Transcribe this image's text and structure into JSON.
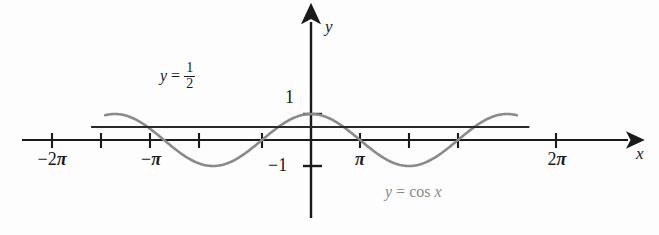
{
  "figure": {
    "background_color": "#fdfdfd"
  },
  "axes": {
    "x_axis_label": "x",
    "y_axis_label": "y",
    "axis_color": "#1a1a1a",
    "x_tick_labels": [
      {
        "text": "−2",
        "pi": "π",
        "value": -6.2832
      },
      {
        "text": "−",
        "pi": "π",
        "value": -3.1416
      },
      {
        "text": "",
        "pi": "π",
        "value": 3.1416
      },
      {
        "text": "2",
        "pi": "π",
        "value": 6.2832
      }
    ],
    "y_tick_labels": [
      {
        "text": "1",
        "value": 1
      },
      {
        "text": "−1",
        "value": -1
      }
    ]
  },
  "annotations": {
    "half_line_label": {
      "lhs": "y",
      "eq": "=",
      "num": "1",
      "den": "2"
    },
    "cosine_label": {
      "lhs": "y",
      "eq": "=",
      "fn": "cos",
      "arg": "x"
    }
  },
  "chart_data": {
    "type": "line",
    "title": "",
    "xlabel": "x",
    "ylabel": "y",
    "xlim": [
      -7.5,
      7.6
    ],
    "ylim": [
      -1.6,
      2.1
    ],
    "grid": false,
    "legend": "inline-annotations",
    "x_ticks": [
      -6.2832,
      -4.7124,
      -3.1416,
      -1.5708,
      1.5708,
      3.1416,
      4.7124,
      6.2832
    ],
    "x_tick_text": [
      "−2π",
      "",
      "−π",
      "",
      "",
      "π",
      "",
      "2π"
    ],
    "y_ticks": [
      1,
      -1
    ],
    "y_tick_text": [
      "1",
      "−1"
    ],
    "series": [
      {
        "name": "y = cos x",
        "type": "line",
        "color": "#8a8a8a",
        "width": 2.6,
        "expression": "cos(x)",
        "x_range": [
          -6.6,
          6.6
        ],
        "amplitude": 1,
        "period": 6.2832,
        "key_points": [
          {
            "x": -6.2832,
            "y": 1
          },
          {
            "x": -4.7124,
            "y": 0
          },
          {
            "x": -3.1416,
            "y": -1
          },
          {
            "x": -1.5708,
            "y": 0
          },
          {
            "x": 0,
            "y": 1
          },
          {
            "x": 1.5708,
            "y": 0
          },
          {
            "x": 3.1416,
            "y": -1
          },
          {
            "x": 4.7124,
            "y": 0
          },
          {
            "x": 6.2832,
            "y": 1
          }
        ]
      },
      {
        "name": "y = 1/2",
        "type": "hline",
        "color": "#2a2a2a",
        "width": 2.2,
        "expression": "0.5",
        "y_value": 0.5,
        "x_range": [
          -7.05,
          7.0
        ]
      }
    ],
    "intersections": [
      {
        "x": -5.236,
        "y": 0.5
      },
      {
        "x": -1.047,
        "y": 0.5
      },
      {
        "x": 1.047,
        "y": 0.5
      },
      {
        "x": 5.236,
        "y": 0.5
      }
    ]
  }
}
